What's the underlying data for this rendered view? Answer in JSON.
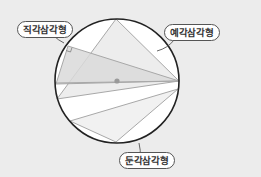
{
  "diagram": {
    "colors": {
      "background": "#ececec",
      "circle_fill": "#ffffff",
      "circle_stroke": "#222222",
      "line": "#a8a8a8",
      "right_fill": "#d9d9d9",
      "acute_fill": "#ededed",
      "obtuse_fill": "#f1f1f1",
      "center_dot": "#9a9a9a"
    },
    "circle": {
      "cx": 117,
      "cy": 81,
      "r": 62
    },
    "center_point": {
      "x": 117,
      "y": 81
    },
    "triangles": [
      {
        "id": "right",
        "label": "직각삼각형",
        "points": "68,46 179,81 56,84",
        "note": "diameter as hypotenuse, right angle on circle"
      },
      {
        "id": "acute",
        "label": "예각삼각형",
        "points": "116,19 179,81 57,99"
      },
      {
        "id": "obtuse",
        "label": "둔각삼각형",
        "points": "116,142 178,89 70,121"
      }
    ],
    "labels": {
      "right": "직각삼각형",
      "acute": "예각삼각형",
      "obtuse": "둔각삼각형"
    }
  }
}
